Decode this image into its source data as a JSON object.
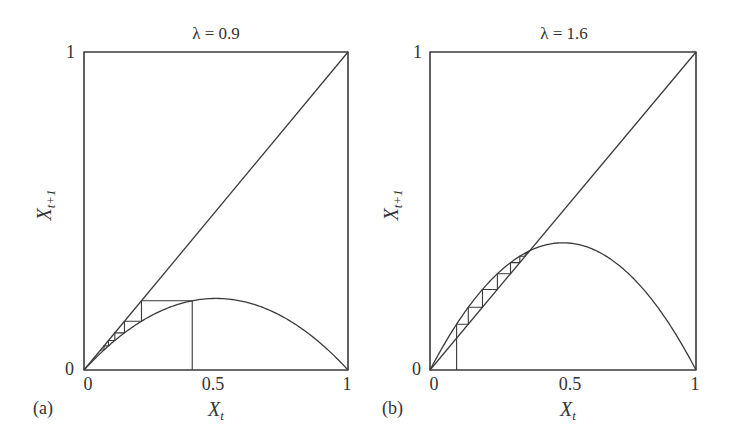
{
  "figure": {
    "panels": [
      {
        "tag": "(a)",
        "title": "λ = 0.9",
        "x_label": "X",
        "x_label_sub": "t",
        "y_label": "X",
        "y_label_sub": "t+1",
        "x_ticks": [
          "0",
          "0.5",
          "1"
        ],
        "y_ticks": [
          "0",
          "1"
        ]
      },
      {
        "tag": "(b)",
        "title": "λ = 1.6",
        "x_label": "X",
        "x_label_sub": "t",
        "y_label": "X",
        "y_label_sub": "t+1",
        "x_ticks": [
          "0",
          "0.5",
          "1"
        ],
        "y_ticks": [
          "0",
          "1"
        ]
      }
    ],
    "line_color": "#3a3a3a",
    "background": "#ffffff"
  },
  "chart_data": [
    {
      "type": "line",
      "title": "λ = 0.9",
      "panel_tag": "(a)",
      "xlabel": "X_t",
      "ylabel": "X_{t+1}",
      "xlim": [
        0,
        1
      ],
      "ylim": [
        0,
        1
      ],
      "grid": false,
      "legend": "none",
      "map": "X_{t+1} = λ X_t (1 − X_t)",
      "lambda": 0.9,
      "series": [
        {
          "name": "map curve",
          "description": "logistic parabola, peak ≈ 0.225 at X_t = 0.5",
          "x": [
            0,
            0.1,
            0.2,
            0.3,
            0.4,
            0.5,
            0.6,
            0.7,
            0.8,
            0.9,
            1.0
          ],
          "y": [
            0,
            0.081,
            0.144,
            0.189,
            0.216,
            0.225,
            0.216,
            0.189,
            0.144,
            0.081,
            0
          ]
        },
        {
          "name": "identity line",
          "x": [
            0,
            1
          ],
          "y": [
            0,
            1
          ]
        },
        {
          "name": "cobweb",
          "x0": 0.41,
          "iterations": 6,
          "description": "converges to fixed point 0 (extinction)"
        }
      ]
    },
    {
      "type": "line",
      "title": "λ = 1.6",
      "panel_tag": "(b)",
      "xlabel": "X_t",
      "ylabel": "X_{t+1}",
      "xlim": [
        0,
        1
      ],
      "ylim": [
        0,
        1
      ],
      "grid": false,
      "legend": "none",
      "map": "X_{t+1} = λ X_t (1 − X_t)",
      "lambda": 1.6,
      "series": [
        {
          "name": "map curve",
          "description": "logistic parabola, peak ≈ 0.4 at X_t = 0.5",
          "x": [
            0,
            0.1,
            0.2,
            0.3,
            0.4,
            0.5,
            0.6,
            0.7,
            0.8,
            0.9,
            1.0
          ],
          "y": [
            0,
            0.144,
            0.256,
            0.336,
            0.384,
            0.4,
            0.384,
            0.336,
            0.256,
            0.144,
            0
          ]
        },
        {
          "name": "identity line",
          "x": [
            0,
            1
          ],
          "y": [
            0,
            1
          ]
        },
        {
          "name": "cobweb",
          "x0": 0.1,
          "iterations": 14,
          "description": "converges monotonically to fixed point 1 − 1/λ = 0.375"
        }
      ]
    }
  ]
}
